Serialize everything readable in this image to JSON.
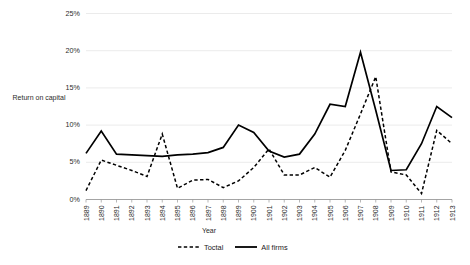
{
  "chart_data": {
    "type": "line",
    "title": "",
    "xlabel": "Year",
    "ylabel": "Return on capital",
    "ylim": [
      0,
      25
    ],
    "yticks": [
      "0%",
      "5%",
      "10%",
      "15%",
      "20%",
      "25%"
    ],
    "ytick_values": [
      0,
      5,
      10,
      15,
      20,
      25
    ],
    "grid": true,
    "grid_axis": "y",
    "legend_position": "bottom",
    "categories": [
      "1889",
      "1890",
      "1891",
      "1892",
      "1893",
      "1894",
      "1895",
      "1896",
      "1897",
      "1898",
      "1899",
      "1900",
      "1901",
      "1902",
      "1903",
      "1904",
      "1905",
      "1906",
      "1907",
      "1908",
      "1909",
      "1910",
      "1911",
      "1912",
      "1913"
    ],
    "series": [
      {
        "name": "Toctal",
        "style": "dashed",
        "color": "#000000",
        "values": [
          1.2,
          5.3,
          4.6,
          3.9,
          3.1,
          8.8,
          1.5,
          2.6,
          2.7,
          1.6,
          2.5,
          4.3,
          6.8,
          3.3,
          3.3,
          4.3,
          3.0,
          6.6,
          11.5,
          16.5,
          3.7,
          3.3,
          0.8,
          9.3,
          7.5
        ]
      },
      {
        "name": "All firms",
        "style": "solid",
        "color": "#000000",
        "values": [
          6.2,
          9.2,
          6.1,
          6.0,
          5.9,
          5.8,
          6.0,
          6.1,
          6.3,
          7.0,
          10.0,
          9.0,
          6.5,
          5.7,
          6.1,
          8.8,
          12.8,
          12.5,
          19.8,
          12.0,
          3.9,
          4.0,
          7.5,
          12.5,
          11.0
        ]
      }
    ]
  },
  "legend": {
    "items": [
      {
        "label": "Toctal",
        "style": "dashed"
      },
      {
        "label": "All firms",
        "style": "solid"
      }
    ]
  }
}
